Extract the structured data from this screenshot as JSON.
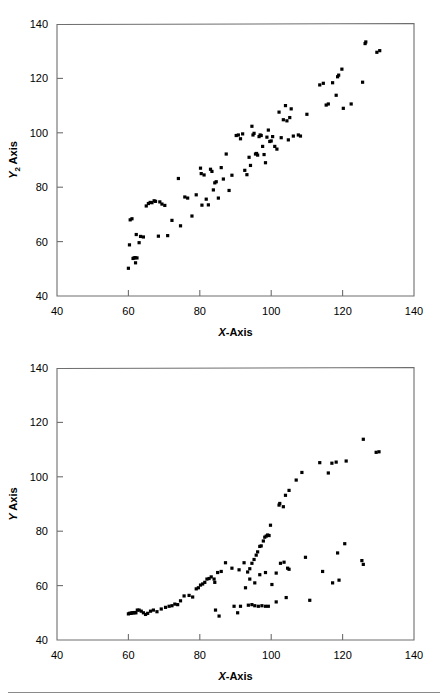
{
  "page": {
    "background": "#ffffff",
    "marker_color": "#000000",
    "axis_color": "#6e6e6e",
    "text_color": "#000000",
    "footer_rule": true
  },
  "charts": [
    {
      "id": "top",
      "title": "",
      "xlabel": "X-Axis",
      "ylabel": "Y2 Axis",
      "ylabel_base": "Y",
      "ylabel_sub": "2",
      "ylabel_tail": " Axis",
      "xticks": [
        40,
        60,
        80,
        100,
        120,
        140
      ],
      "yticks": [
        40,
        60,
        80,
        100,
        120,
        140
      ],
      "xlim": [
        40,
        140
      ],
      "ylim": [
        40,
        140
      ]
    },
    {
      "id": "bottom",
      "title": "",
      "xlabel": "X-Axis",
      "ylabel": "Y Axis",
      "ylabel_base": "Y",
      "ylabel_sub": "",
      "ylabel_tail": " Axis",
      "xticks": [
        40,
        60,
        80,
        100,
        120,
        140
      ],
      "yticks": [
        40,
        60,
        80,
        100,
        120,
        140
      ],
      "xlim": [
        40,
        140
      ],
      "ylim": [
        40,
        140
      ]
    }
  ],
  "chart_data": [
    {
      "type": "scatter",
      "id": "top-scatter",
      "title": "",
      "xlabel": "X-Axis",
      "ylabel": "Y2 Axis",
      "xlim": [
        40,
        140
      ],
      "ylim": [
        40,
        140
      ],
      "xticks": [
        40,
        60,
        80,
        100,
        120,
        140
      ],
      "yticks": [
        40,
        60,
        80,
        100,
        120,
        140
      ],
      "grid": false,
      "legend": false,
      "marker": "square",
      "series": [
        {
          "name": "series-1",
          "points": [
            [
              60.0,
              50.2
            ],
            [
              60.3,
              58.8
            ],
            [
              60.5,
              68.0
            ],
            [
              61.0,
              68.4
            ],
            [
              61.3,
              53.8
            ],
            [
              61.6,
              54.0
            ],
            [
              61.9,
              54.1
            ],
            [
              62.0,
              52.2
            ],
            [
              62.2,
              62.6
            ],
            [
              62.4,
              54.0
            ],
            [
              63.0,
              59.6
            ],
            [
              63.4,
              61.9
            ],
            [
              64.2,
              61.7
            ],
            [
              65.0,
              73.1
            ],
            [
              65.6,
              74.0
            ],
            [
              66.1,
              74.4
            ],
            [
              66.6,
              74.3
            ],
            [
              67.2,
              75.0
            ],
            [
              67.6,
              74.8
            ],
            [
              68.4,
              62.0
            ],
            [
              68.8,
              74.6
            ],
            [
              69.4,
              73.8
            ],
            [
              70.2,
              73.3
            ],
            [
              71.0,
              62.2
            ],
            [
              72.2,
              67.8
            ],
            [
              74.0,
              83.2
            ],
            [
              74.6,
              65.8
            ],
            [
              75.8,
              76.4
            ],
            [
              76.6,
              76.0
            ],
            [
              77.8,
              69.4
            ],
            [
              79.0,
              77.2
            ],
            [
              80.2,
              87.0
            ],
            [
              80.4,
              85.0
            ],
            [
              80.6,
              73.4
            ],
            [
              81.2,
              84.5
            ],
            [
              81.8,
              75.6
            ],
            [
              82.4,
              73.5
            ],
            [
              83.0,
              86.6
            ],
            [
              83.4,
              85.8
            ],
            [
              83.8,
              79.0
            ],
            [
              84.2,
              81.6
            ],
            [
              84.6,
              82.0
            ],
            [
              85.2,
              76.0
            ],
            [
              86.0,
              87.2
            ],
            [
              86.6,
              83.0
            ],
            [
              87.4,
              92.2
            ],
            [
              88.2,
              78.8
            ],
            [
              89.0,
              84.4
            ],
            [
              90.2,
              99.0
            ],
            [
              90.8,
              99.2
            ],
            [
              91.4,
              97.8
            ],
            [
              92.0,
              99.6
            ],
            [
              92.6,
              86.2
            ],
            [
              93.2,
              84.6
            ],
            [
              93.8,
              91.0
            ],
            [
              94.2,
              88.0
            ],
            [
              94.6,
              102.4
            ],
            [
              94.9,
              99.2
            ],
            [
              95.2,
              99.8
            ],
            [
              95.6,
              92.2
            ],
            [
              95.9,
              92.4
            ],
            [
              96.2,
              91.8
            ],
            [
              96.6,
              98.6
            ],
            [
              96.9,
              99.2
            ],
            [
              97.2,
              99.0
            ],
            [
              97.6,
              95.0
            ],
            [
              98.0,
              92.0
            ],
            [
              98.4,
              89.0
            ],
            [
              98.8,
              98.4
            ],
            [
              99.2,
              101.0
            ],
            [
              99.6,
              96.8
            ],
            [
              100.0,
              97.0
            ],
            [
              100.4,
              98.6
            ],
            [
              101.0,
              95.0
            ],
            [
              101.6,
              94.0
            ],
            [
              102.2,
              107.6
            ],
            [
              102.8,
              98.2
            ],
            [
              103.4,
              104.8
            ],
            [
              104.0,
              110.0
            ],
            [
              104.4,
              104.4
            ],
            [
              104.8,
              97.4
            ],
            [
              105.2,
              105.6
            ],
            [
              105.6,
              108.8
            ],
            [
              106.2,
              98.8
            ],
            [
              107.6,
              99.2
            ],
            [
              108.2,
              98.8
            ],
            [
              110.0,
              106.8
            ],
            [
              113.6,
              117.6
            ],
            [
              114.6,
              118.2
            ],
            [
              115.4,
              110.2
            ],
            [
              116.0,
              110.6
            ],
            [
              117.2,
              118.4
            ],
            [
              118.2,
              113.8
            ],
            [
              118.6,
              120.6
            ],
            [
              118.9,
              121.2
            ],
            [
              119.8,
              123.4
            ],
            [
              120.2,
              109.0
            ],
            [
              122.4,
              110.6
            ],
            [
              125.6,
              118.6
            ],
            [
              126.3,
              132.8
            ],
            [
              126.5,
              133.4
            ],
            [
              129.6,
              129.6
            ],
            [
              130.4,
              130.2
            ]
          ]
        }
      ]
    },
    {
      "type": "scatter",
      "id": "bottom-scatter",
      "title": "",
      "xlabel": "X-Axis",
      "ylabel": "Y Axis",
      "xlim": [
        40,
        140
      ],
      "ylim": [
        40,
        140
      ],
      "xticks": [
        40,
        60,
        80,
        100,
        120,
        140
      ],
      "yticks": [
        40,
        60,
        80,
        100,
        120,
        140
      ],
      "grid": false,
      "legend": false,
      "marker": "square",
      "series": [
        {
          "name": "upper-branch",
          "points": [
            [
              60.0,
              49.6
            ],
            [
              60.3,
              49.8
            ],
            [
              60.6,
              49.8
            ],
            [
              60.9,
              49.9
            ],
            [
              61.2,
              50.0
            ],
            [
              61.5,
              50.0
            ],
            [
              61.8,
              50.1
            ],
            [
              62.1,
              50.0
            ],
            [
              62.5,
              51.0
            ],
            [
              63.0,
              51.0
            ],
            [
              63.6,
              50.6
            ],
            [
              64.2,
              50.0
            ],
            [
              64.8,
              49.4
            ],
            [
              65.4,
              49.8
            ],
            [
              66.2,
              50.6
            ],
            [
              67.0,
              51.0
            ],
            [
              68.0,
              50.4
            ],
            [
              69.2,
              51.4
            ],
            [
              70.4,
              52.0
            ],
            [
              71.4,
              52.4
            ],
            [
              72.2,
              52.6
            ],
            [
              73.0,
              53.2
            ],
            [
              73.8,
              53.0
            ],
            [
              74.6,
              54.4
            ],
            [
              75.6,
              56.2
            ],
            [
              77.0,
              56.4
            ],
            [
              78.0,
              55.8
            ],
            [
              79.0,
              58.8
            ],
            [
              79.6,
              59.2
            ],
            [
              80.2,
              60.2
            ],
            [
              80.8,
              60.6
            ],
            [
              81.4,
              61.2
            ],
            [
              82.0,
              62.4
            ],
            [
              82.6,
              62.6
            ],
            [
              83.2,
              63.2
            ],
            [
              84.0,
              62.4
            ],
            [
              84.2,
              61.2
            ],
            [
              85.0,
              64.8
            ],
            [
              86.0,
              65.2
            ],
            [
              87.2,
              68.4
            ],
            [
              89.0,
              66.4
            ],
            [
              91.0,
              65.8
            ],
            [
              92.4,
              68.4
            ],
            [
              93.4,
              65.0
            ],
            [
              94.0,
              66.2
            ],
            [
              94.6,
              68.2
            ],
            [
              95.2,
              69.6
            ],
            [
              95.8,
              71.2
            ],
            [
              96.2,
              72.4
            ],
            [
              96.8,
              74.4
            ],
            [
              97.2,
              74.6
            ],
            [
              97.8,
              76.4
            ],
            [
              98.2,
              77.8
            ],
            [
              98.6,
              78.2
            ],
            [
              99.0,
              78.6
            ],
            [
              99.4,
              78.4
            ],
            [
              99.8,
              82.2
            ],
            [
              102.2,
              89.6
            ],
            [
              102.4,
              90.2
            ],
            [
              103.4,
              89.0
            ],
            [
              104.0,
              93.2
            ],
            [
              105.0,
              95.0
            ],
            [
              107.0,
              98.8
            ],
            [
              108.6,
              101.6
            ],
            [
              113.6,
              105.2
            ],
            [
              116.0,
              101.4
            ],
            [
              117.0,
              105.0
            ],
            [
              118.2,
              105.4
            ],
            [
              121.0,
              105.8
            ],
            [
              125.8,
              113.8
            ],
            [
              129.4,
              109.0
            ],
            [
              130.2,
              109.2
            ]
          ]
        },
        {
          "name": "middle-branch",
          "points": [
            [
              92.8,
              59.2
            ],
            [
              94.0,
              62.4
            ],
            [
              95.4,
              61.0
            ],
            [
              96.8,
              64.0
            ],
            [
              98.4,
              64.8
            ],
            [
              100.2,
              60.4
            ],
            [
              101.4,
              64.6
            ],
            [
              102.6,
              68.2
            ],
            [
              103.6,
              68.6
            ],
            [
              104.6,
              66.4
            ],
            [
              105.0,
              66.0
            ],
            [
              109.6,
              70.4
            ],
            [
              114.4,
              65.2
            ],
            [
              117.2,
              61.0
            ],
            [
              118.6,
              72.0
            ],
            [
              119.0,
              62.0
            ],
            [
              120.6,
              75.4
            ],
            [
              125.4,
              69.2
            ],
            [
              125.8,
              67.8
            ]
          ]
        },
        {
          "name": "lower-branch",
          "points": [
            [
              84.4,
              51.0
            ],
            [
              85.4,
              48.8
            ],
            [
              89.6,
              52.4
            ],
            [
              90.6,
              50.0
            ],
            [
              91.4,
              52.4
            ],
            [
              93.6,
              52.8
            ],
            [
              94.6,
              53.0
            ],
            [
              95.4,
              52.6
            ],
            [
              96.4,
              52.4
            ],
            [
              97.4,
              52.6
            ],
            [
              98.4,
              52.4
            ],
            [
              99.2,
              52.4
            ],
            [
              101.4,
              54.0
            ],
            [
              104.2,
              55.6
            ],
            [
              110.8,
              54.6
            ]
          ]
        }
      ]
    }
  ]
}
